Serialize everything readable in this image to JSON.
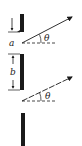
{
  "diagram": {
    "labels": {
      "slit_width": "a",
      "separation": "b",
      "angle_top": "θ",
      "angle_bottom": "θ"
    },
    "colors": {
      "ink": "#1a1a1a",
      "background": "#ffffff"
    }
  }
}
